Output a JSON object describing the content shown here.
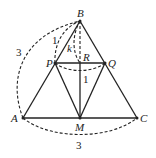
{
  "diagram": {
    "points": {
      "B": {
        "label": "B",
        "x": 80,
        "y": 21
      },
      "P": {
        "label": "P",
        "x": 55,
        "y": 63
      },
      "Q": {
        "label": "Q",
        "x": 105,
        "y": 63
      },
      "R": {
        "label": "R",
        "x": 80,
        "y": 63
      },
      "A": {
        "label": "A",
        "x": 23,
        "y": 118
      },
      "M": {
        "label": "M",
        "x": 80,
        "y": 118
      },
      "C": {
        "label": "C",
        "x": 137,
        "y": 118
      }
    },
    "measurements": {
      "arc_AB": "3",
      "arc_AC": "3",
      "arc_BP": "1",
      "arc_PQ": "1",
      "angle_k": "k"
    }
  }
}
